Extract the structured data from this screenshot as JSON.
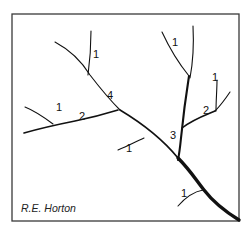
{
  "figure": {
    "credit": "R.E. Horton",
    "colors": {
      "stroke": "#111111",
      "frame": "#3a3a3a",
      "background": "#ffffff"
    }
  },
  "order_labels": [
    {
      "id": "top-left-1",
      "text": "1"
    },
    {
      "id": "main-4",
      "text": "4"
    },
    {
      "id": "left-1",
      "text": "1"
    },
    {
      "id": "left-2",
      "text": "2"
    },
    {
      "id": "top-right-1",
      "text": "1"
    },
    {
      "id": "right-1",
      "text": "1"
    },
    {
      "id": "right-2",
      "text": "2"
    },
    {
      "id": "trunk-3",
      "text": "3"
    },
    {
      "id": "mid-1",
      "text": "1"
    },
    {
      "id": "bottom-1",
      "text": "1"
    }
  ]
}
